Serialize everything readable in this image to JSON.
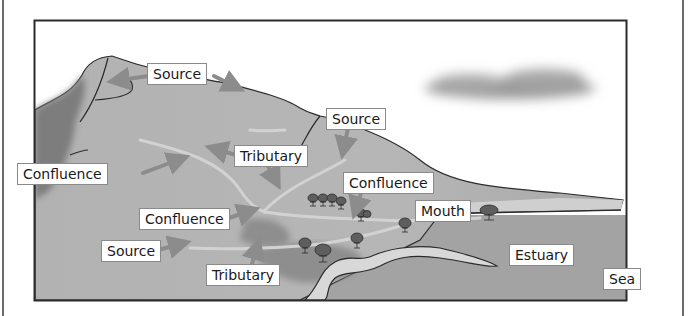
{
  "diagram": {
    "colors": {
      "frame": "#2b2b2b",
      "sky": "#ffffff",
      "land_light": "#b9b9b9",
      "land_mid": "#a9a9a9",
      "land_dark": "#7f7f7f",
      "river": "#d0d0d0",
      "sea": "#a4a4a4",
      "estuary_water": "#dcdcdc",
      "cloud": "#9a9a9a",
      "tree": "#5e5e5e",
      "arrow": "#8c8c8c"
    },
    "labels": [
      {
        "id": "source-1",
        "text": "Source",
        "x": 147,
        "y": 63
      },
      {
        "id": "source-2",
        "text": "Source",
        "x": 326,
        "y": 108
      },
      {
        "id": "tributary-1",
        "text": "Tributary",
        "x": 234,
        "y": 145
      },
      {
        "id": "confluence-1",
        "text": "Confluence",
        "x": 17,
        "y": 163
      },
      {
        "id": "confluence-2",
        "text": "Confluence",
        "x": 343,
        "y": 172
      },
      {
        "id": "mouth",
        "text": "Mouth",
        "x": 415,
        "y": 200
      },
      {
        "id": "confluence-3",
        "text": "Confluence",
        "x": 139,
        "y": 208
      },
      {
        "id": "source-3",
        "text": "Source",
        "x": 101,
        "y": 240
      },
      {
        "id": "estuary",
        "text": "Estuary",
        "x": 509,
        "y": 244
      },
      {
        "id": "tributary-2",
        "text": "Tributary",
        "x": 206,
        "y": 264
      },
      {
        "id": "sea",
        "text": "Sea",
        "x": 603,
        "y": 268
      }
    ]
  }
}
